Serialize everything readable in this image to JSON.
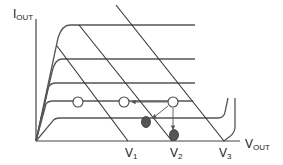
{
  "diagram": {
    "type": "transistor output characteristics with load lines",
    "y_axis": {
      "label_main": "I",
      "label_sub": "OUT"
    },
    "x_axis": {
      "label_main": "V",
      "label_sub": "OUT"
    },
    "voltage_markers": [
      {
        "main": "V",
        "sub": "1"
      },
      {
        "main": "V",
        "sub": "2"
      },
      {
        "main": "V",
        "sub": "3"
      }
    ],
    "curves_count": 5,
    "load_lines_count": 3,
    "operating_points": {
      "open": 3,
      "filled": 2
    },
    "colors": {
      "line": "#555555",
      "filled_point": "#555555",
      "background": "#ffffff"
    }
  }
}
